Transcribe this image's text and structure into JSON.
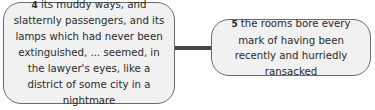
{
  "nodes": [
    {
      "number": "4",
      "text": "its muddy ways, and slatternly passengers, and its lamps which had never been extinguished, ... seemed, in the lawyer's eyes, like a district of some city in a nightmare"
    },
    {
      "number": "5",
      "text": "the rooms bore every mark of having been recently and hurriedly ransacked"
    }
  ],
  "edges": [
    {
      "from": "4",
      "to": "5"
    }
  ],
  "colors": {
    "node_fill": "#f1f1f1",
    "node_border": "#6a6a6a",
    "edge": "#444444"
  }
}
